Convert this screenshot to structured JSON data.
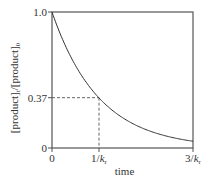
{
  "chart_data": {
    "type": "line",
    "title": "",
    "xlabel": "time",
    "ylabel": "[product]_t/[product]_0",
    "ylabel_parts": {
      "a": "[product]",
      "a_sub": "t",
      "sep": "/",
      "b": "[product]",
      "b_sub": "0"
    },
    "xlim": [
      0,
      3
    ],
    "ylim": [
      0,
      1.0
    ],
    "x_ticks": [
      {
        "value": 0,
        "label": "0",
        "sub": ""
      },
      {
        "value": 1,
        "label": "1/k",
        "sub": "r"
      },
      {
        "value": 3,
        "label": "3/k",
        "sub": "r"
      }
    ],
    "y_ticks": [
      {
        "value": 0,
        "label": "0"
      },
      {
        "value": 0.37,
        "label": "0.37"
      },
      {
        "value": 1.0,
        "label": "1.0"
      }
    ],
    "series": [
      {
        "name": "exponential decay",
        "function": "exp(-x)",
        "x_range": [
          0,
          3
        ]
      }
    ],
    "annotations": [
      {
        "type": "dashed-guide",
        "x": 1,
        "y": 0.37
      }
    ],
    "grid": false,
    "frame": "box"
  }
}
